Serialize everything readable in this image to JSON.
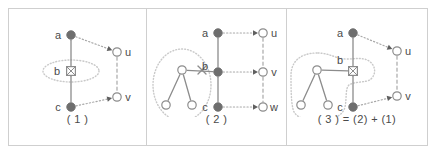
{
  "figure": {
    "background": "#ffffff",
    "frame_color": "#cfcfcf",
    "colors": {
      "filled_node": "#6e6e6e",
      "open_node_stroke": "#8c8c8c",
      "open_node_fill": "#ffffff",
      "solid_edge": "#8c8c8c",
      "dotted_edge": "#a8a8a8",
      "dashed_edge": "#a8a8a8",
      "region_outline": "#c9c9c9",
      "label_text": "#4a4a4a",
      "cross_mark": "#8c8c8c"
    }
  },
  "panels": [
    {
      "id": "panel-1",
      "caption": "( 1 )",
      "nodes": [
        {
          "id": "a",
          "label": "a",
          "style": "filled",
          "x": 62,
          "y": 26,
          "label_dx": -13,
          "label_dy": 4
        },
        {
          "id": "b",
          "label": "b",
          "style": "crossed-square",
          "x": 62,
          "y": 62,
          "label_dx": -14,
          "label_dy": 4
        },
        {
          "id": "c",
          "label": "c",
          "style": "filled",
          "x": 62,
          "y": 98,
          "label_dx": -13,
          "label_dy": 4
        },
        {
          "id": "u",
          "label": "u",
          "style": "open",
          "x": 108,
          "y": 43,
          "label_dx": 11,
          "label_dy": 4
        },
        {
          "id": "v",
          "label": "v",
          "style": "open",
          "x": 108,
          "y": 88,
          "label_dx": 11,
          "label_dy": 4
        }
      ],
      "edges": [
        {
          "from": "a",
          "to": "b",
          "style": "solid"
        },
        {
          "from": "b",
          "to": "c",
          "style": "solid"
        },
        {
          "from": "a",
          "to": "u",
          "style": "dotted",
          "arrow": true
        },
        {
          "from": "c",
          "to": "v",
          "style": "dotted",
          "arrow": true
        },
        {
          "from": "u",
          "to": "v",
          "style": "dashed"
        }
      ],
      "regions": [
        {
          "shape": "ellipse",
          "cx": 62,
          "cy": 62,
          "rx": 28,
          "ry": 11
        }
      ],
      "cross_marks": []
    },
    {
      "id": "panel-2",
      "caption": "( 2 )",
      "nodes": [
        {
          "id": "a",
          "label": "a",
          "style": "filled",
          "x": 71,
          "y": 24,
          "label_dx": -13,
          "label_dy": 4
        },
        {
          "id": "b",
          "label": "b",
          "style": "filled",
          "x": 71,
          "y": 63,
          "label_dx": -13,
          "label_dy": -2
        },
        {
          "id": "c",
          "label": "c",
          "style": "filled",
          "x": 71,
          "y": 98,
          "label_dx": -13,
          "label_dy": 4
        },
        {
          "id": "u",
          "label": "u",
          "style": "open",
          "x": 116,
          "y": 24,
          "label_dx": 11,
          "label_dy": 4
        },
        {
          "id": "v",
          "label": "v",
          "style": "open",
          "x": 116,
          "y": 63,
          "label_dx": 11,
          "label_dy": 4
        },
        {
          "id": "w",
          "label": "w",
          "style": "open",
          "x": 116,
          "y": 98,
          "label_dx": 11,
          "label_dy": 4
        },
        {
          "id": "s1",
          "label": "",
          "style": "open",
          "x": 35,
          "y": 61,
          "label_dx": 0,
          "label_dy": 0
        },
        {
          "id": "s2",
          "label": "",
          "style": "open",
          "x": 19,
          "y": 96,
          "label_dx": 0,
          "label_dy": 0
        },
        {
          "id": "s3",
          "label": "",
          "style": "open",
          "x": 45,
          "y": 96,
          "label_dx": 0,
          "label_dy": 0
        }
      ],
      "edges": [
        {
          "from": "a",
          "to": "b",
          "style": "solid"
        },
        {
          "from": "b",
          "to": "c",
          "style": "solid"
        },
        {
          "from": "a",
          "to": "u",
          "style": "dotted",
          "arrow": true
        },
        {
          "from": "b",
          "to": "v",
          "style": "dotted",
          "arrow": true
        },
        {
          "from": "c",
          "to": "w",
          "style": "dotted",
          "arrow": true
        },
        {
          "from": "u",
          "to": "v",
          "style": "dashed"
        },
        {
          "from": "v",
          "to": "w",
          "style": "dashed"
        },
        {
          "from": "s1",
          "to": "s2",
          "style": "solid"
        },
        {
          "from": "s1",
          "to": "s3",
          "style": "solid"
        },
        {
          "from": "s1",
          "to": "b",
          "style": "solid"
        }
      ],
      "regions": [
        {
          "shape": "ellipse",
          "cx": 35,
          "cy": 76,
          "rx": 29,
          "ry": 36
        }
      ],
      "cross_marks": [
        {
          "x": 55,
          "y": 61,
          "size": 4
        }
      ]
    },
    {
      "id": "panel-3",
      "caption": "( 3 ) = (2) + (1)",
      "nodes": [
        {
          "id": "a",
          "label": "a",
          "style": "filled",
          "x": 66,
          "y": 24,
          "label_dx": -13,
          "label_dy": 4
        },
        {
          "id": "b",
          "label": "b",
          "style": "crossed-square",
          "x": 66,
          "y": 62,
          "label_dx": -13,
          "label_dy": -7
        },
        {
          "id": "c",
          "label": "c",
          "style": "filled",
          "x": 66,
          "y": 98,
          "label_dx": -13,
          "label_dy": 4
        },
        {
          "id": "u",
          "label": "u",
          "style": "open",
          "x": 110,
          "y": 42,
          "label_dx": 11,
          "label_dy": 4
        },
        {
          "id": "v",
          "label": "v",
          "style": "open",
          "x": 110,
          "y": 87,
          "label_dx": 11,
          "label_dy": 4
        },
        {
          "id": "s1",
          "label": "",
          "style": "open",
          "x": 30,
          "y": 61,
          "label_dx": 0,
          "label_dy": 0
        },
        {
          "id": "s2",
          "label": "",
          "style": "open",
          "x": 14,
          "y": 96,
          "label_dx": 0,
          "label_dy": 0
        },
        {
          "id": "s3",
          "label": "",
          "style": "open",
          "x": 41,
          "y": 96,
          "label_dx": 0,
          "label_dy": 0
        }
      ],
      "edges": [
        {
          "from": "a",
          "to": "b",
          "style": "solid"
        },
        {
          "from": "b",
          "to": "c",
          "style": "solid"
        },
        {
          "from": "a",
          "to": "u",
          "style": "dotted",
          "arrow": true
        },
        {
          "from": "c",
          "to": "v",
          "style": "dotted",
          "arrow": true
        },
        {
          "from": "u",
          "to": "v",
          "style": "dashed"
        },
        {
          "from": "s1",
          "to": "s2",
          "style": "solid"
        },
        {
          "from": "s1",
          "to": "s3",
          "style": "solid"
        },
        {
          "from": "s1",
          "to": "b",
          "style": "solid"
        }
      ],
      "regions": [
        {
          "shape": "blob",
          "path": "M 30 44 C 12 44 4 54 4 66 C 4 78 4 92 6 100 C 8 110 22 112 36 111 C 48 110 56 106 58 98 C 60 88 58 80 62 76 C 68 72 80 74 84 70 C 90 64 88 56 82 52 C 76 48 68 50 60 50 C 48 50 44 44 30 44 Z"
        }
      ],
      "cross_marks": []
    }
  ]
}
